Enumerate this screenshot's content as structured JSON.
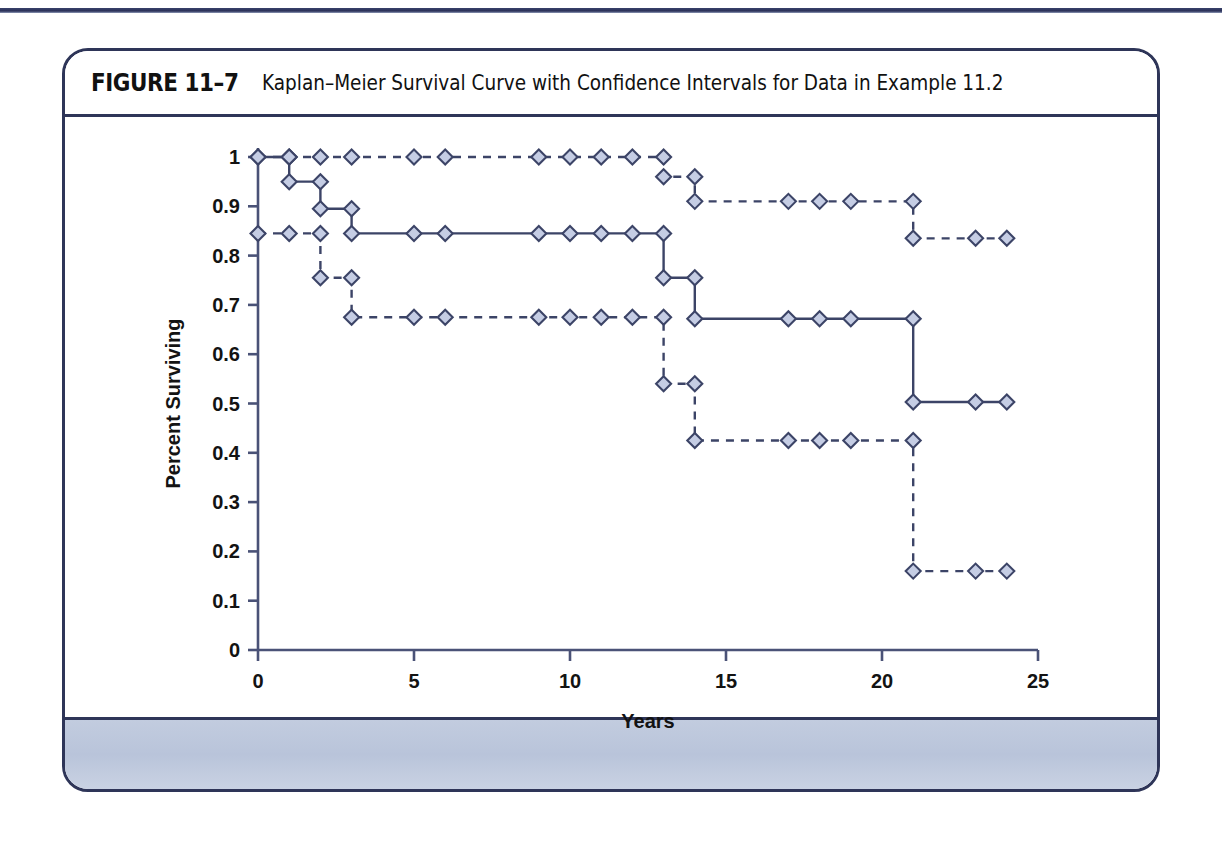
{
  "page": {
    "background_color": "#ffffff",
    "rule_color": "#2e3558"
  },
  "figure": {
    "label": "FIGURE 11–7",
    "title": "Kaplan–Meier Survival Curve with Confidence Intervals for Data in Example 11.2",
    "border_color": "#2e3558",
    "footer_color": "#c2ccdf"
  },
  "chart_data": {
    "type": "line",
    "title": "Kaplan–Meier Survival Curve with Confidence Intervals for Data in Example 11.2",
    "xlabel": "Years",
    "ylabel": "Percent Surviving",
    "xlim": [
      0,
      25
    ],
    "ylim": [
      0,
      1
    ],
    "xticks": [
      0,
      5,
      10,
      15,
      20,
      25
    ],
    "xtick_labels": [
      "0",
      "5",
      "10",
      "15",
      "20",
      "25"
    ],
    "yticks": [
      0,
      0.1,
      0.2,
      0.3,
      0.4,
      0.5,
      0.6,
      0.7,
      0.8,
      0.9,
      1
    ],
    "ytick_labels": [
      "0",
      "0.1",
      "0.2",
      "0.3",
      "0.4",
      "0.5",
      "0.6",
      "0.7",
      "0.8",
      "0.9",
      "1"
    ],
    "grid": false,
    "legend": "none",
    "marker": "diamond",
    "marker_fill": "#c5cde4",
    "marker_edge": "#3c4467",
    "line_color": "#3c4467",
    "series": [
      {
        "name": "Upper 95% confidence limit",
        "style": "dashed",
        "step": "post",
        "x": [
          0,
          1,
          2,
          3,
          5,
          6,
          9,
          10,
          11,
          12,
          13,
          13,
          14,
          14,
          17,
          18,
          19,
          21,
          21,
          23,
          24
        ],
        "y": [
          1,
          1,
          1,
          1,
          1,
          1,
          1,
          1,
          1,
          1,
          1,
          0.96,
          0.96,
          0.91,
          0.91,
          0.91,
          0.91,
          0.91,
          0.835,
          0.835,
          0.835
        ]
      },
      {
        "name": "Kaplan–Meier survival estimate",
        "style": "solid",
        "step": "post",
        "x": [
          0,
          1,
          1,
          2,
          2,
          3,
          3,
          5,
          6,
          9,
          10,
          11,
          12,
          13,
          13,
          14,
          14,
          17,
          18,
          19,
          21,
          21,
          23,
          24
        ],
        "y": [
          1,
          1,
          0.95,
          0.95,
          0.895,
          0.895,
          0.845,
          0.845,
          0.845,
          0.845,
          0.845,
          0.845,
          0.845,
          0.845,
          0.755,
          0.755,
          0.672,
          0.672,
          0.672,
          0.672,
          0.672,
          0.503,
          0.503,
          0.503
        ]
      },
      {
        "name": "Lower 95% confidence limit",
        "style": "dashed",
        "step": "post",
        "x": [
          0,
          1,
          2,
          2,
          3,
          3,
          5,
          6,
          9,
          10,
          11,
          12,
          13,
          13,
          14,
          14,
          17,
          18,
          19,
          21,
          21,
          23,
          24
        ],
        "y": [
          0.845,
          0.845,
          0.845,
          0.755,
          0.755,
          0.675,
          0.675,
          0.675,
          0.675,
          0.675,
          0.675,
          0.675,
          0.675,
          0.54,
          0.54,
          0.425,
          0.425,
          0.425,
          0.425,
          0.425,
          0.16,
          0.16,
          0.16
        ]
      }
    ]
  }
}
